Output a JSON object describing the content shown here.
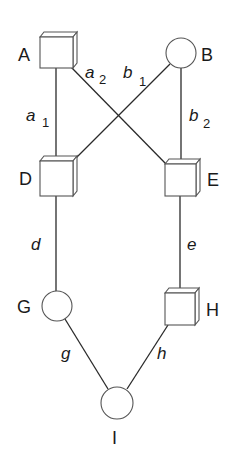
{
  "diagram": {
    "nodes": [
      {
        "id": "A",
        "label": "A",
        "shape": "box"
      },
      {
        "id": "B",
        "label": "B",
        "shape": "circle"
      },
      {
        "id": "D",
        "label": "D",
        "shape": "box"
      },
      {
        "id": "E",
        "label": "E",
        "shape": "box"
      },
      {
        "id": "G",
        "label": "G",
        "shape": "circle"
      },
      {
        "id": "H",
        "label": "H",
        "shape": "box"
      },
      {
        "id": "I",
        "label": "I",
        "shape": "circle"
      }
    ],
    "edges": [
      {
        "from": "A",
        "to": "D",
        "label": "a",
        "sub": "1"
      },
      {
        "from": "A",
        "to": "E",
        "label": "a",
        "sub": "2"
      },
      {
        "from": "B",
        "to": "D",
        "label": "b",
        "sub": "1"
      },
      {
        "from": "B",
        "to": "E",
        "label": "b",
        "sub": "2"
      },
      {
        "from": "D",
        "to": "G",
        "label": "d",
        "sub": ""
      },
      {
        "from": "E",
        "to": "H",
        "label": "e",
        "sub": ""
      },
      {
        "from": "G",
        "to": "I",
        "label": "g",
        "sub": ""
      },
      {
        "from": "H",
        "to": "I",
        "label": "h",
        "sub": ""
      }
    ]
  }
}
